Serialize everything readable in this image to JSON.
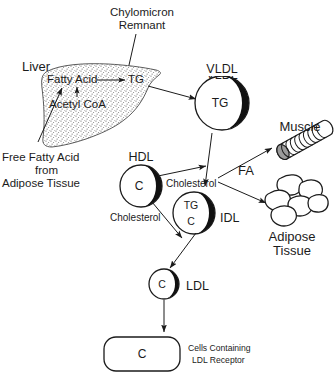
{
  "diagram": {
    "background_color": "#ffffff",
    "ink_color": "#1b1b1b"
  },
  "labels": {
    "chylomicron_remnant": "Chylomicron\nRemnant",
    "chylomicron_remnant_line1": "Chylomicron",
    "chylomicron_remnant_line2": "Remnant",
    "liver": "Liver",
    "fatty_acid": "Fatty Acid",
    "acetyl_coa": "Acetyl CoA",
    "tg_liver": "TG",
    "free_fatty_acid_line1": "Free Fatty Acid",
    "free_fatty_acid_line2": "from",
    "free_fatty_acid_line3": "Adipose Tissue",
    "vldl": "VLDL",
    "vldl_core": "TG",
    "muscle": "Muscle",
    "fa": "FA",
    "adipose_line1": "Adipose",
    "adipose_line2": "Tissue",
    "hdl": "HDL",
    "hdl_core": "C",
    "cholesterol_upper": "Cholesterol",
    "cholesterol_lower": "Cholesterol",
    "idl": "IDL",
    "idl_core_top": "TG",
    "idl_core_bottom": "C",
    "ldl": "LDL",
    "ldl_core": "C",
    "target_cell_core": "C",
    "target_cell_line1": "Cells Containing",
    "target_cell_line2": "LDL Receptor"
  },
  "particles": [
    {
      "name": "VLDL",
      "core": "TG",
      "cx": 222,
      "cy": 103,
      "r": 27
    },
    {
      "name": "HDL",
      "core": "C",
      "cx": 141,
      "cy": 186,
      "r": 21
    },
    {
      "name": "IDL",
      "core": "TG / C",
      "cx": 194,
      "cy": 213,
      "r": 21
    },
    {
      "name": "LDL",
      "core": "C",
      "cx": 164,
      "cy": 284,
      "r": 15
    }
  ],
  "flows": [
    {
      "from": "Chylomicron Remnant",
      "to": "Liver"
    },
    {
      "from": "Acetyl CoA",
      "to": "Fatty Acid"
    },
    {
      "from": "Free Fatty Acid from Adipose Tissue",
      "to": "Fatty Acid"
    },
    {
      "from": "Fatty Acid",
      "to": "TG"
    },
    {
      "from": "Liver",
      "to": "VLDL"
    },
    {
      "from": "VLDL",
      "to": "IDL"
    },
    {
      "from": "VLDL",
      "to": "Muscle",
      "label": "FA"
    },
    {
      "from": "VLDL",
      "to": "Adipose Tissue",
      "label": "FA"
    },
    {
      "from": "HDL",
      "to": "VLDL",
      "label": "Cholesterol"
    },
    {
      "from": "HDL",
      "to": "IDL",
      "label": "Cholesterol"
    },
    {
      "from": "IDL",
      "to": "LDL"
    },
    {
      "from": "LDL",
      "to": "Cells Containing LDL Receptor"
    }
  ]
}
